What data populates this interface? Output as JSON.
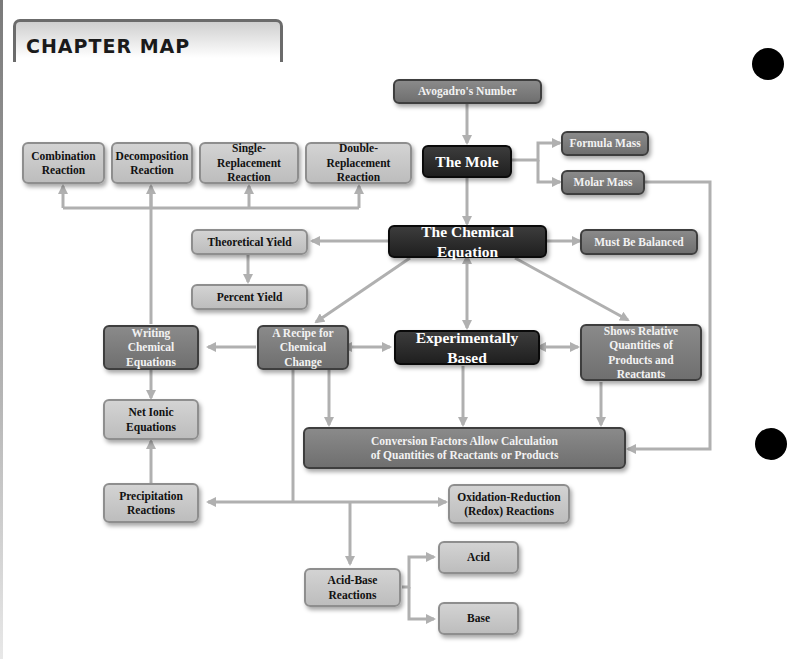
{
  "header": {
    "title": "CHAPTER MAP"
  },
  "colors": {
    "line": "#b0b0b0",
    "light_box": "#c8c8c8",
    "mid_box": "#7d7d7d",
    "dark_box": "#2c2c2c"
  },
  "nodes": {
    "avogadro": "Avogadro's Number",
    "mole": "The Mole",
    "formula_mass": "Formula Mass",
    "molar_mass": "Molar Mass",
    "combination": "Combination Reaction",
    "decomposition": "Decomposition Reaction",
    "single_replacement": "Single-Replacement Reaction",
    "double_replacement": "Double-Replacement Reaction",
    "chemical_equation": "The Chemical Equation",
    "theoretical_yield": "Theoretical Yield",
    "percent_yield": "Percent Yield",
    "must_be_balanced": "Must Be Balanced",
    "writing_equations": "Writing Chemical Equations",
    "recipe": "A Recipe for Chemical Change",
    "experimentally_based": "Experimentally Based",
    "shows_relative": "Shows Relative Quantities of Products and Reactants",
    "net_ionic": "Net Ionic Equations",
    "conversion_factors": "Conversion Factors Allow Calculation of Quantities of Reactants or Products",
    "precipitation": "Precipitation Reactions",
    "redox": "Oxidation-Reduction (Redox) Reactions",
    "acid_base": "Acid-Base Reactions",
    "acid": "Acid",
    "base": "Base"
  }
}
